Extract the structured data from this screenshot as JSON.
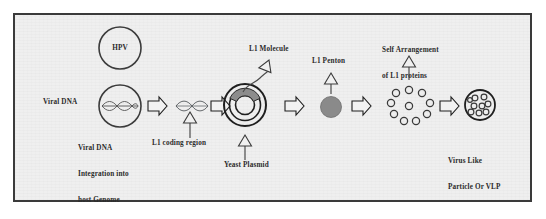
{
  "figure": {
    "title_text": "",
    "background_color": "#efefef",
    "border_color": "#3a3a3a",
    "ink_color": "#2b2b2b",
    "fill_gray": "#8c8c8c"
  },
  "nodes": {
    "hpv": {
      "label": "HPV",
      "shape": "open-circle",
      "cx": 120,
      "cy": 48,
      "r": 21
    },
    "viral_dna": {
      "label": "Viral DNA",
      "shape": "circle-with-dna",
      "cx": 120,
      "cy": 106,
      "r": 21
    },
    "viral_dna_caption": {
      "line1": "Viral DNA",
      "line2": "Integration into",
      "line3": "host Genome"
    },
    "l1_coding_region": {
      "label": "L1 coding region",
      "shape": "dna-helix"
    },
    "yeast_plasmid": {
      "label": "Yeast Plasmid",
      "shape": "concentric-rings",
      "cx": 245,
      "cy": 105,
      "rings": 3
    },
    "l1_molecule": {
      "label": "L1 Molecule",
      "shape": "arc-segment"
    },
    "l1_penton": {
      "label": "L1 Penton",
      "shape": "filled-circle",
      "cx": 331,
      "cy": 107,
      "r": 10
    },
    "self_arrangement": {
      "line1": "Self Arrangement",
      "line2": "of L1 proteins",
      "shape": "circle-ring-of-subunits",
      "subunit_count": 10
    },
    "vlp": {
      "line1": "Virus Like",
      "line2": "Particle Or VLP",
      "shape": "capsid-circle",
      "cx": 480,
      "cy": 105,
      "r": 15,
      "subunit_count": 9
    }
  },
  "flow_arrows": {
    "count": 5,
    "style": "hollow-block-arrow",
    "direction": "right"
  },
  "pointer_arrows": {
    "style": "hollow-triangle-with-stem",
    "items": [
      {
        "name": "l1-coding-region-pointer",
        "direction": "up"
      },
      {
        "name": "yeast-plasmid-pointer",
        "direction": "up"
      },
      {
        "name": "l1-molecule-pointer",
        "direction": "up-curved"
      },
      {
        "name": "l1-penton-pointer",
        "direction": "up"
      },
      {
        "name": "self-arrangement-pointer",
        "direction": "up"
      }
    ]
  }
}
